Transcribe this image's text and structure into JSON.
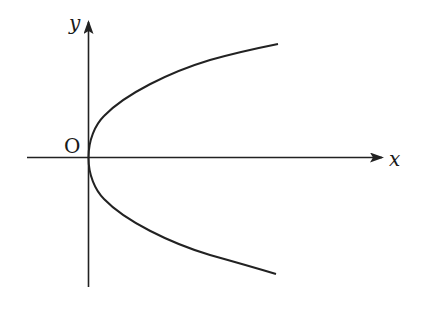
{
  "diagram": {
    "axes": {
      "x_label": "x",
      "y_label": "y",
      "origin_label": "O"
    },
    "curve": {
      "type": "parabola",
      "equation_form": "y^2 = 2px (p > 0)",
      "vertex": "O",
      "opens": "right"
    },
    "colors": {
      "stroke": "#222222",
      "background": "#ffffff"
    }
  }
}
